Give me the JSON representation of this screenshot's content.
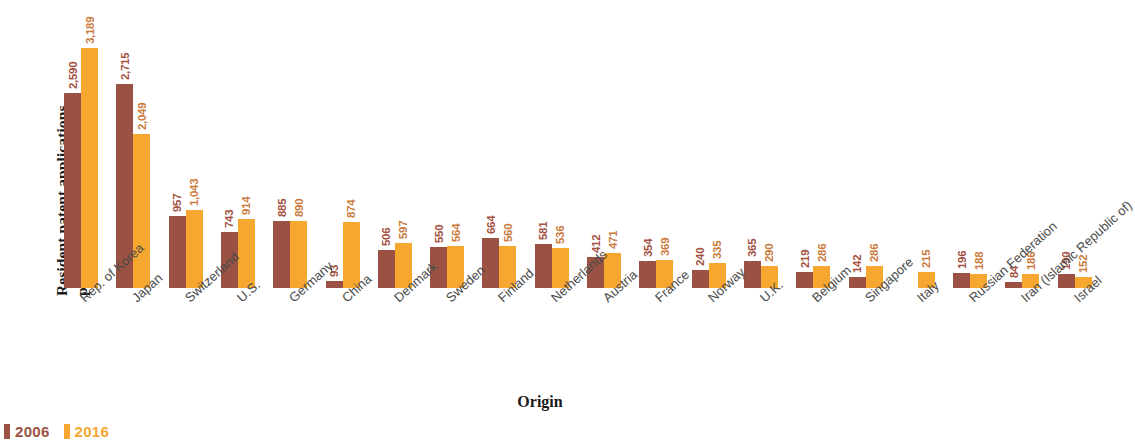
{
  "chart_data": {
    "type": "bar",
    "title": "",
    "xlabel": "Origin",
    "ylabel": "Resident patent applications per million population",
    "ylim": [
      0,
      3189
    ],
    "grid": false,
    "legend_position": "bottom-left",
    "categories": [
      "Rep. of Korea",
      "Japan",
      "Switzerland",
      "U.S.",
      "Germany",
      "China",
      "Denmark",
      "Sweden",
      "Finland",
      "Netherlands",
      "Austria",
      "France",
      "Norway",
      "U.K.",
      "Belgium",
      "Singapore",
      "Italy",
      "Russian Federation",
      "Iran (Islamic Republic of)",
      "Israel"
    ],
    "series": [
      {
        "name": "2006",
        "color": "#9b5243",
        "values": [
          2590,
          2715,
          957,
          743,
          885,
          93,
          506,
          550,
          664,
          581,
          412,
          354,
          240,
          365,
          219,
          142,
          null,
          196,
          84,
          190
        ],
        "labels": [
          "2,590",
          "2,715",
          "957",
          "743",
          "885",
          "93",
          "506",
          "550",
          "664",
          "581",
          "412",
          "354",
          "240",
          "365",
          "219",
          "142",
          "",
          "196",
          "84",
          "190"
        ]
      },
      {
        "name": "2016",
        "color": "#f6a72f",
        "values": [
          3189,
          2049,
          1043,
          914,
          890,
          874,
          597,
          564,
          560,
          536,
          471,
          369,
          335,
          290,
          286,
          286,
          215,
          188,
          186,
          152
        ],
        "labels": [
          "3,189",
          "2,049",
          "1,043",
          "914",
          "890",
          "874",
          "597",
          "564",
          "560",
          "536",
          "471",
          "369",
          "335",
          "290",
          "286",
          "286",
          "215",
          "188",
          "186",
          "152"
        ]
      }
    ]
  },
  "legend": {
    "items": [
      {
        "label": "2006",
        "color": "#9b5243"
      },
      {
        "label": "2016",
        "color": "#f6a72f"
      }
    ]
  }
}
